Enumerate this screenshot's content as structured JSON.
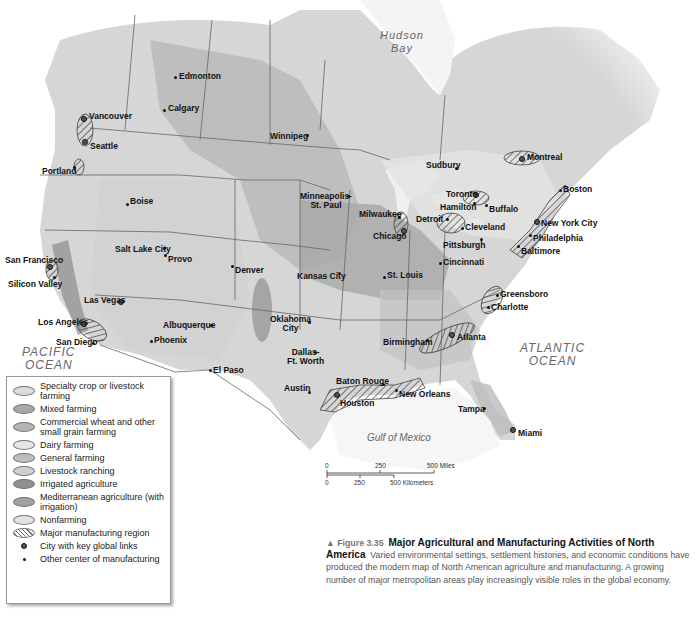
{
  "figure": {
    "marker": "▲",
    "number": "Figure 3.35",
    "title": "Major Agricultural and Manufacturing Activities of North America",
    "description": "Varied environmental settings, settlement histories, and economic conditions have produced the modern map of North American agriculture and manufacturing. A growing number of major metropolitan areas play increasingly visible roles in the global economy."
  },
  "water_bodies": {
    "hudson_bay": [
      "Hudson",
      "Bay"
    ],
    "pacific": [
      "PACIFIC",
      "OCEAN"
    ],
    "atlantic": [
      "ATLANTIC",
      "OCEAN"
    ],
    "gulf": "Gulf of Mexico"
  },
  "legend": {
    "items": [
      {
        "label": "Specialty crop or livestock farming",
        "color": "#dcdcdc",
        "kind": "area"
      },
      {
        "label": "Mixed farming",
        "color": "#a9a9a9",
        "kind": "area"
      },
      {
        "label": "Commercial wheat and other small grain farming",
        "color": "#b4b4b4",
        "kind": "area"
      },
      {
        "label": "Dairy farming",
        "color": "#e6e6e6",
        "kind": "area"
      },
      {
        "label": "General farming",
        "color": "#bdbdbd",
        "kind": "area"
      },
      {
        "label": "Livestock ranching",
        "color": "#cfcfcf",
        "kind": "area"
      },
      {
        "label": "Irrigated agriculture",
        "color": "#8f8f8f",
        "kind": "area"
      },
      {
        "label": "Mediterranean agriculture (with irrigation)",
        "color": "#a0a0a0",
        "kind": "area"
      },
      {
        "label": "Nonfarming",
        "color": "#e2e2e2",
        "kind": "area"
      },
      {
        "label": "Major manufacturing region",
        "color": "#666666",
        "kind": "hatch"
      },
      {
        "label": "City with key global links",
        "kind": "global-city"
      },
      {
        "label": "Other center of manufacturing",
        "kind": "city"
      }
    ]
  },
  "scale_bar": {
    "miles": [
      "0",
      "250",
      "500 Miles"
    ],
    "kilometers": [
      "0",
      "250",
      "500 Kilometers"
    ]
  },
  "cities": [
    {
      "name": "Edmonton",
      "x": 175,
      "y": 77,
      "global": false,
      "lx": 179,
      "ly": 72
    },
    {
      "name": "Calgary",
      "x": 164,
      "y": 110,
      "global": false,
      "lx": 168,
      "ly": 104
    },
    {
      "name": "Vancouver",
      "x": 84,
      "y": 119,
      "global": true,
      "lx": 89,
      "ly": 112
    },
    {
      "name": "Seattle",
      "x": 85,
      "y": 142,
      "global": true,
      "lx": 90,
      "ly": 142
    },
    {
      "name": "Portland",
      "x": 74,
      "y": 167,
      "global": false,
      "lx": 42,
      "ly": 167
    },
    {
      "name": "Winnipeg",
      "x": 307,
      "y": 135,
      "global": false,
      "lx": 270,
      "ly": 132
    },
    {
      "name": "Boise",
      "x": 127,
      "y": 204,
      "global": false,
      "lx": 130,
      "ly": 197
    },
    {
      "name": "Salt Lake City",
      "x": 164,
      "y": 248,
      "global": false,
      "lx": 115,
      "ly": 245
    },
    {
      "name": "Provo",
      "x": 165,
      "y": 255,
      "global": false,
      "lx": 168,
      "ly": 255
    },
    {
      "name": "Denver",
      "x": 232,
      "y": 266,
      "global": false,
      "lx": 235,
      "ly": 266
    },
    {
      "name": "San Francisco",
      "x": 50,
      "y": 267,
      "global": true,
      "lx": 5,
      "ly": 256
    },
    {
      "name": "Silicon Valley",
      "x": 54,
      "y": 277,
      "global": false,
      "lx": 8,
      "ly": 280
    },
    {
      "name": "Las Vegas",
      "x": 121,
      "y": 302,
      "global": true,
      "lx": 84,
      "ly": 296
    },
    {
      "name": "Los Angeles",
      "x": 84,
      "y": 324,
      "global": true,
      "lx": 38,
      "ly": 318
    },
    {
      "name": "San Diego",
      "x": 93,
      "y": 343,
      "global": false,
      "lx": 56,
      "ly": 338
    },
    {
      "name": "Albuquerque",
      "x": 211,
      "y": 325,
      "global": false,
      "lx": 163,
      "ly": 321
    },
    {
      "name": "Phoenix",
      "x": 151,
      "y": 341,
      "global": false,
      "lx": 154,
      "ly": 336
    },
    {
      "name": "El Paso",
      "x": 210,
      "y": 370,
      "global": false,
      "lx": 213,
      "ly": 366
    },
    {
      "name": "Minneapolis-St. Paul",
      "x": 348,
      "y": 196,
      "global": false,
      "lx": 300,
      "ly": 192,
      "multiline": [
        "Minneapolis-",
        "St. Paul"
      ]
    },
    {
      "name": "Milwaukee",
      "x": 399,
      "y": 217,
      "global": false,
      "lx": 359,
      "ly": 210
    },
    {
      "name": "Chicago",
      "x": 404,
      "y": 231,
      "global": true,
      "lx": 373,
      "ly": 232
    },
    {
      "name": "Detroit",
      "x": 447,
      "y": 219,
      "global": false,
      "lx": 416,
      "ly": 215
    },
    {
      "name": "Toronto",
      "x": 476,
      "y": 195,
      "global": true,
      "lx": 446,
      "ly": 190
    },
    {
      "name": "Hamilton",
      "x": 474,
      "y": 203,
      "global": false,
      "lx": 440,
      "ly": 203
    },
    {
      "name": "Buffalo",
      "x": 486,
      "y": 205,
      "global": false,
      "lx": 489,
      "ly": 205
    },
    {
      "name": "Cleveland",
      "x": 462,
      "y": 228,
      "global": false,
      "lx": 465,
      "ly": 223
    },
    {
      "name": "Pittsburgh",
      "x": 481,
      "y": 239,
      "global": false,
      "lx": 443,
      "ly": 241
    },
    {
      "name": "Cincinnati",
      "x": 440,
      "y": 263,
      "global": false,
      "lx": 443,
      "ly": 258
    },
    {
      "name": "Sudbury",
      "x": 456,
      "y": 168,
      "global": false,
      "lx": 426,
      "ly": 161
    },
    {
      "name": "Montreal",
      "x": 522,
      "y": 159,
      "global": true,
      "lx": 527,
      "ly": 153
    },
    {
      "name": "Boston",
      "x": 560,
      "y": 190,
      "global": false,
      "lx": 563,
      "ly": 185
    },
    {
      "name": "New York City",
      "x": 537,
      "y": 222,
      "global": true,
      "lx": 541,
      "ly": 219
    },
    {
      "name": "Philadelphia",
      "x": 530,
      "y": 235,
      "global": false,
      "lx": 533,
      "ly": 234
    },
    {
      "name": "Baltimore",
      "x": 518,
      "y": 246,
      "global": false,
      "lx": 521,
      "ly": 247
    },
    {
      "name": "Kansas City",
      "x": 339,
      "y": 273,
      "global": false,
      "lx": 297,
      "ly": 272
    },
    {
      "name": "St. Louis",
      "x": 384,
      "y": 277,
      "global": false,
      "lx": 387,
      "ly": 271
    },
    {
      "name": "Oklahoma City",
      "x": 309,
      "y": 322,
      "global": false,
      "lx": 270,
      "ly": 315,
      "multiline": [
        "Oklahoma",
        "City"
      ]
    },
    {
      "name": "Dallas-Ft. Worth",
      "x": 315,
      "y": 352,
      "global": false,
      "lx": 287,
      "ly": 348,
      "multiline": [
        "Dallas-",
        "Ft. Worth"
      ]
    },
    {
      "name": "Austin",
      "x": 309,
      "y": 392,
      "global": false,
      "lx": 284,
      "ly": 384
    },
    {
      "name": "Birmingham",
      "x": 427,
      "y": 340,
      "global": false,
      "lx": 383,
      "ly": 338
    },
    {
      "name": "Atlanta",
      "x": 452,
      "y": 335,
      "global": true,
      "lx": 457,
      "ly": 333
    },
    {
      "name": "Greensboro",
      "x": 497,
      "y": 295,
      "global": false,
      "lx": 500,
      "ly": 290
    },
    {
      "name": "Charlotte",
      "x": 488,
      "y": 307,
      "global": false,
      "lx": 491,
      "ly": 303
    },
    {
      "name": "Baton Rouge",
      "x": 383,
      "y": 384,
      "global": false,
      "lx": 336,
      "ly": 377
    },
    {
      "name": "New Orleans",
      "x": 396,
      "y": 390,
      "global": false,
      "lx": 399,
      "ly": 390
    },
    {
      "name": "Houston",
      "x": 337,
      "y": 395,
      "global": true,
      "lx": 340,
      "ly": 399
    },
    {
      "name": "Tampa",
      "x": 484,
      "y": 408,
      "global": false,
      "lx": 458,
      "ly": 405
    },
    {
      "name": "Miami",
      "x": 513,
      "y": 430,
      "global": true,
      "lx": 518,
      "ly": 429
    }
  ]
}
